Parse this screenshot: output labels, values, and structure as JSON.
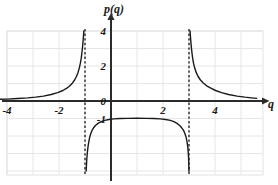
{
  "chart_data": {
    "type": "line",
    "title": "",
    "xlabel": "q",
    "ylabel": "p(q)",
    "xlim": [
      -4.3,
      5.6
    ],
    "ylim": [
      -4.0,
      4.0
    ],
    "grid": true,
    "legend": null,
    "x_ticks": [
      {
        "value": -4,
        "label": "-4"
      },
      {
        "value": -2,
        "label": "-2"
      },
      {
        "value": 2,
        "label": "2"
      },
      {
        "value": 4,
        "label": "4"
      }
    ],
    "y_ticks": [
      {
        "value": 4,
        "label": "4"
      },
      {
        "value": 2,
        "label": "2"
      },
      {
        "value": 0,
        "label": "0"
      },
      {
        "value": -1,
        "label": "-1"
      }
    ],
    "asymptotes": {
      "vertical": [
        -1,
        3
      ],
      "horizontal": [
        0
      ],
      "style": "dashed"
    },
    "annotations": [],
    "series": [
      {
        "name": "left-branch",
        "note": "increases from y=0 at far left up toward +infinity at q=-1",
        "points": [
          [
            -4.3,
            0.1
          ],
          [
            -4.0,
            0.11
          ],
          [
            -3.6,
            0.14
          ],
          [
            -3.2,
            0.18
          ],
          [
            -2.9,
            0.22
          ],
          [
            -2.6,
            0.28
          ],
          [
            -2.3,
            0.37
          ],
          [
            -2.05,
            0.48
          ],
          [
            -1.85,
            0.6
          ],
          [
            -1.7,
            0.73
          ],
          [
            -1.58,
            0.87
          ],
          [
            -1.48,
            1.03
          ],
          [
            -1.4,
            1.2
          ],
          [
            -1.33,
            1.4
          ],
          [
            -1.27,
            1.62
          ],
          [
            -1.22,
            1.88
          ],
          [
            -1.18,
            2.15
          ],
          [
            -1.145,
            2.45
          ],
          [
            -1.115,
            2.8
          ],
          [
            -1.09,
            3.15
          ],
          [
            -1.07,
            3.5
          ],
          [
            -1.055,
            3.8
          ],
          [
            -1.045,
            4.0
          ]
        ]
      },
      {
        "name": "middle-branch",
        "note": "from -infinity at q=-1, rises to maximum near y=-1 at q=1, falls to -infinity at q=3",
        "points": [
          [
            -0.955,
            -4.0
          ],
          [
            -0.945,
            -3.7
          ],
          [
            -0.93,
            -3.3
          ],
          [
            -0.91,
            -2.95
          ],
          [
            -0.885,
            -2.62
          ],
          [
            -0.855,
            -2.33
          ],
          [
            -0.82,
            -2.08
          ],
          [
            -0.78,
            -1.87
          ],
          [
            -0.73,
            -1.68
          ],
          [
            -0.67,
            -1.53
          ],
          [
            -0.6,
            -1.4
          ],
          [
            -0.5,
            -1.28
          ],
          [
            -0.38,
            -1.18
          ],
          [
            -0.24,
            -1.11
          ],
          [
            -0.08,
            -1.06
          ],
          [
            0.1,
            -1.02
          ],
          [
            0.35,
            -1.0
          ],
          [
            0.65,
            -0.99
          ],
          [
            1.0,
            -0.985
          ],
          [
            1.35,
            -0.99
          ],
          [
            1.65,
            -1.0
          ],
          [
            1.9,
            -1.02
          ],
          [
            2.1,
            -1.06
          ],
          [
            2.28,
            -1.11
          ],
          [
            2.42,
            -1.18
          ],
          [
            2.54,
            -1.28
          ],
          [
            2.64,
            -1.4
          ],
          [
            2.72,
            -1.53
          ],
          [
            2.79,
            -1.68
          ],
          [
            2.845,
            -1.87
          ],
          [
            2.89,
            -2.08
          ],
          [
            2.925,
            -2.33
          ],
          [
            2.952,
            -2.62
          ],
          [
            2.972,
            -2.95
          ],
          [
            2.985,
            -3.3
          ],
          [
            2.994,
            -3.7
          ],
          [
            2.998,
            -4.0
          ]
        ]
      },
      {
        "name": "right-branch",
        "note": "from +infinity at q=3, decreases toward y=0 at far right",
        "points": [
          [
            3.04,
            4.0
          ],
          [
            3.05,
            3.8
          ],
          [
            3.065,
            3.5
          ],
          [
            3.085,
            3.15
          ],
          [
            3.11,
            2.8
          ],
          [
            3.14,
            2.45
          ],
          [
            3.175,
            2.15
          ],
          [
            3.22,
            1.88
          ],
          [
            3.28,
            1.62
          ],
          [
            3.35,
            1.4
          ],
          [
            3.44,
            1.2
          ],
          [
            3.55,
            1.03
          ],
          [
            3.68,
            0.87
          ],
          [
            3.84,
            0.73
          ],
          [
            4.02,
            0.6
          ],
          [
            4.25,
            0.48
          ],
          [
            4.52,
            0.37
          ],
          [
            4.85,
            0.28
          ],
          [
            5.15,
            0.22
          ],
          [
            5.4,
            0.18
          ],
          [
            5.6,
            0.15
          ]
        ]
      }
    ]
  },
  "figure": {
    "y_axis_title": "p(q)",
    "x_axis_title": "q",
    "x_tick_labels": [
      "-4",
      "-2",
      "2",
      "4"
    ],
    "y_tick_labels": [
      "4",
      "2",
      "0",
      "-1"
    ]
  }
}
